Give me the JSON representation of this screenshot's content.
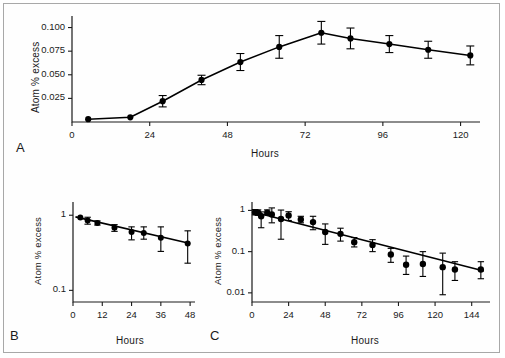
{
  "figure": {
    "panel_a_letter": "A",
    "panel_b_letter": "B",
    "panel_c_letter": "C"
  },
  "chart_data": [
    {
      "panel": "A",
      "type": "line",
      "title": "",
      "xlabel": "Hours",
      "ylabel": "Atom % excess",
      "xlim": [
        0,
        126
      ],
      "ylim": [
        0,
        0.108
      ],
      "yscale": "linear",
      "xticks": [
        0,
        24,
        48,
        72,
        96,
        120
      ],
      "xticklabels": [
        "0",
        "24",
        "48",
        "72",
        "96",
        "120"
      ],
      "yticks": [
        0.025,
        0.05,
        0.075,
        0.1
      ],
      "yticklabels": [
        "0.025",
        "0.050",
        "0.075",
        "0.100"
      ],
      "grid": false,
      "legend": "none",
      "x": [
        5,
        18,
        28,
        40,
        52,
        64,
        77,
        86,
        98,
        110,
        123
      ],
      "values": [
        0.003,
        0.005,
        0.022,
        0.0445,
        0.0635,
        0.0795,
        0.0945,
        0.0885,
        0.0825,
        0.0765,
        0.0705
      ],
      "yerr_low": [
        0.002,
        0.002,
        0.006,
        0.005,
        0.009,
        0.012,
        0.012,
        0.011,
        0.009,
        0.009,
        0.01
      ],
      "yerr_high": [
        0.002,
        0.002,
        0.006,
        0.005,
        0.009,
        0.012,
        0.012,
        0.011,
        0.009,
        0.009,
        0.01
      ]
    },
    {
      "panel": "B",
      "type": "scatter",
      "title": "",
      "xlabel": "Hours",
      "ylabel": "Atom % excess",
      "xlim": [
        0,
        50
      ],
      "ylim": [
        0.07,
        1.5
      ],
      "yscale": "log",
      "xticks": [
        0,
        12,
        24,
        36,
        48
      ],
      "xticklabels": [
        "0",
        "12",
        "24",
        "36",
        "48"
      ],
      "yticks": [
        1,
        0.1
      ],
      "yticklabels": [
        "1",
        "0.1"
      ],
      "grid": false,
      "legend": "none",
      "x": [
        3,
        6,
        10,
        17,
        24,
        29,
        36,
        47
      ],
      "values": [
        0.93,
        0.85,
        0.79,
        0.68,
        0.6,
        0.58,
        0.5,
        0.42
      ],
      "yerr_low": [
        0.0,
        0.09,
        0.05,
        0.07,
        0.13,
        0.1,
        0.17,
        0.19
      ],
      "yerr_high": [
        0.0,
        0.09,
        0.05,
        0.07,
        0.1,
        0.12,
        0.2,
        0.2
      ],
      "fit": {
        "x0": 1,
        "y0": 0.95,
        "x1": 48,
        "y1": 0.42
      }
    },
    {
      "panel": "C",
      "type": "scatter",
      "title": "",
      "xlabel": "Hours",
      "ylabel": "Atom % excess",
      "xlim": [
        0,
        156
      ],
      "ylim": [
        0.006,
        1.6
      ],
      "yscale": "log",
      "xticks": [
        0,
        24,
        48,
        72,
        96,
        120,
        144
      ],
      "xticklabels": [
        "0",
        "24",
        "48",
        "72",
        "96",
        "120",
        "144"
      ],
      "yticks": [
        1,
        0.1,
        0.01
      ],
      "yticklabels": [
        "1",
        "0.1",
        "0.01"
      ],
      "grid": false,
      "legend": "none",
      "x": [
        2,
        4,
        6,
        10,
        13,
        19,
        24,
        32,
        40,
        48,
        58,
        67,
        79,
        91,
        101,
        112,
        125,
        133,
        150
      ],
      "values": [
        0.9,
        0.88,
        0.72,
        0.88,
        0.8,
        0.62,
        0.75,
        0.6,
        0.52,
        0.3,
        0.27,
        0.17,
        0.145,
        0.085,
        0.048,
        0.05,
        0.042,
        0.037,
        0.037
      ],
      "yerr_low": [
        0.12,
        0.12,
        0.34,
        0.1,
        0.3,
        0.42,
        0.18,
        0.1,
        0.18,
        0.15,
        0.09,
        0.04,
        0.045,
        0.03,
        0.02,
        0.025,
        0.033,
        0.017,
        0.015
      ],
      "yerr_high": [
        0.15,
        0.15,
        0.2,
        0.15,
        0.35,
        0.4,
        0.18,
        0.12,
        0.2,
        0.17,
        0.1,
        0.05,
        0.05,
        0.035,
        0.03,
        0.05,
        0.05,
        0.02,
        0.02
      ],
      "fit": {
        "x0": 1,
        "y0": 0.92,
        "x1": 152,
        "y1": 0.034
      }
    }
  ]
}
